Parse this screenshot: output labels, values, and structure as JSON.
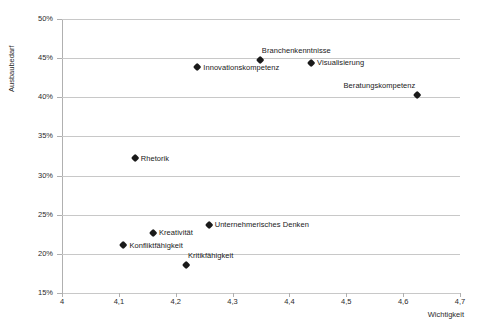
{
  "chart_data": {
    "type": "scatter",
    "title": "",
    "xlabel": "Wichtigkeit",
    "ylabel": "Ausbaubedarf",
    "xlim": [
      4.0,
      4.7
    ],
    "ylim": [
      0.15,
      0.5
    ],
    "grid": true,
    "legend": "none",
    "x_tick_labels": [
      "4",
      "4,1",
      "4,2",
      "4,3",
      "4,4",
      "4,5",
      "4,6",
      "4,7"
    ],
    "x_tick_values": [
      4.0,
      4.1,
      4.2,
      4.3,
      4.4,
      4.5,
      4.6,
      4.7
    ],
    "y_tick_labels": [
      "15%",
      "20%",
      "25%",
      "30%",
      "35%",
      "40%",
      "45%",
      "50%"
    ],
    "y_tick_values": [
      0.15,
      0.2,
      0.25,
      0.3,
      0.35,
      0.4,
      0.45,
      0.5
    ],
    "marker_shape": "diamond",
    "marker_color": "#1a1a1a",
    "grid_color": "#c8c8c8",
    "points": [
      {
        "label": "Innovationskompetenz",
        "x": 4.238,
        "y": 0.438,
        "label_pos": "right"
      },
      {
        "label": "Branchenkenntnisse",
        "x": 4.348,
        "y": 0.448,
        "label_pos": "above-right"
      },
      {
        "label": "Visualisierung",
        "x": 4.438,
        "y": 0.444,
        "label_pos": "right"
      },
      {
        "label": "Beratungskompetenz",
        "x": 4.625,
        "y": 0.403,
        "label_pos": "above-left"
      },
      {
        "label": "Rhetorik",
        "x": 4.128,
        "y": 0.322,
        "label_pos": "right"
      },
      {
        "label": "Unternehmerisches Denken",
        "x": 4.258,
        "y": 0.237,
        "label_pos": "right"
      },
      {
        "label": "Kreativität",
        "x": 4.16,
        "y": 0.227,
        "label_pos": "right"
      },
      {
        "label": "Konfliktfähigkeit",
        "x": 4.108,
        "y": 0.211,
        "label_pos": "right"
      },
      {
        "label": "Kritikfähigkeit",
        "x": 4.218,
        "y": 0.186,
        "label_pos": "above-right"
      }
    ]
  }
}
